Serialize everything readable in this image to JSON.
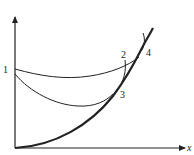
{
  "diagram": {
    "type": "process-curves",
    "axes": {
      "x_label": "x",
      "y_label": ""
    },
    "points": [
      {
        "id": "1",
        "label": "1"
      },
      {
        "id": "2",
        "label": "2"
      },
      {
        "id": "3",
        "label": "3"
      },
      {
        "id": "4",
        "label": "4"
      }
    ],
    "curves": [
      {
        "name": "bold-boundary-curve",
        "description": "thick curve rising from origin through 3 and 4"
      },
      {
        "name": "upper-path-1-to-4",
        "description": "thin curve from 1 to 4"
      },
      {
        "name": "lower-path-1-to-3",
        "description": "thin curve from near 1 dipping down to 3"
      },
      {
        "name": "segment-2-to-3",
        "description": "short near-vertical segment from 2 to 3"
      }
    ],
    "colors": {
      "line": "#222222",
      "background": "#ffffff"
    }
  }
}
